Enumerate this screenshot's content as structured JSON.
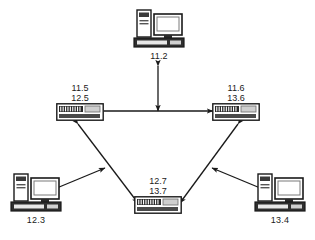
{
  "diagram": {
    "background_color": "#ffffff",
    "line_color": "#1a1a1a",
    "text_color": "#1a1a1a",
    "nodes": [
      {
        "id": "pc-top",
        "type": "computer",
        "icon": "desktop-computer-icon",
        "labels": [
          "11.2"
        ],
        "label_position": "below"
      },
      {
        "id": "switch-left",
        "type": "switch",
        "icon": "network-switch-icon",
        "labels": [
          "11.5",
          "12.5"
        ],
        "label_position": "above"
      },
      {
        "id": "switch-right",
        "type": "switch",
        "icon": "network-switch-icon",
        "labels": [
          "11.6",
          "13.6"
        ],
        "label_position": "above"
      },
      {
        "id": "switch-bottom",
        "type": "switch",
        "icon": "network-switch-icon",
        "labels": [
          "12.7",
          "13.7"
        ],
        "label_position": "above"
      },
      {
        "id": "pc-bottom-left",
        "type": "computer",
        "icon": "desktop-computer-icon",
        "labels": [
          "12.3"
        ],
        "label_position": "below"
      },
      {
        "id": "pc-bottom-right",
        "type": "computer",
        "icon": "desktop-computer-icon",
        "labels": [
          "13.4"
        ],
        "label_position": "below"
      }
    ],
    "links": [
      {
        "id": "link-switch-left-switch-right",
        "from": "switch-left",
        "to": "switch-right",
        "arrow": "double"
      },
      {
        "id": "link-pc-top-trunk",
        "from": "pc-top",
        "to": "switch-trunk",
        "arrow": "double"
      },
      {
        "id": "link-switch-left-switch-bottom",
        "from": "switch-left",
        "to": "switch-bottom",
        "arrow": "double"
      },
      {
        "id": "link-switch-right-switch-bottom",
        "from": "switch-right",
        "to": "switch-bottom",
        "arrow": "double"
      },
      {
        "id": "link-pc-bottom-left-uplink",
        "from": "pc-bottom-left",
        "to": "link-switch-left-switch-bottom",
        "arrow": "double"
      },
      {
        "id": "link-pc-bottom-right-uplink",
        "from": "pc-bottom-right",
        "to": "link-switch-right-switch-bottom",
        "arrow": "double"
      }
    ]
  }
}
